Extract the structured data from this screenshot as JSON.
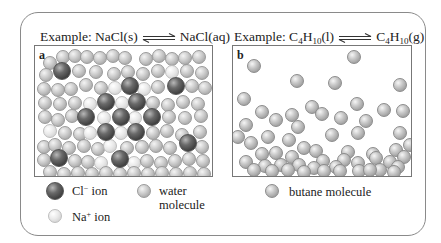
{
  "panel_a": {
    "label": "a",
    "title": {
      "prefix": "Example: ",
      "left": "NaCl(s)",
      "right": "NaCl(aq)"
    },
    "legend": [
      {
        "kind": "cl",
        "text": "Cl",
        "sup": "−",
        "suffix": " ion"
      },
      {
        "kind": "na",
        "text": "Na",
        "sup": "+",
        "suffix": " ion"
      },
      {
        "kind": "water",
        "line1": "water",
        "line2": "molecule"
      }
    ],
    "spheres": [
      {
        "t": "water",
        "x": 8,
        "y": 10
      },
      {
        "t": "water",
        "x": 21,
        "y": 4
      },
      {
        "t": "water",
        "x": 33,
        "y": 3
      },
      {
        "t": "water",
        "x": 45,
        "y": 4
      },
      {
        "t": "water",
        "x": 58,
        "y": 5
      },
      {
        "t": "water",
        "x": 71,
        "y": 3
      },
      {
        "t": "water",
        "x": 83,
        "y": 5
      },
      {
        "t": "water",
        "x": 104,
        "y": 6
      },
      {
        "t": "water",
        "x": 117,
        "y": 3
      },
      {
        "t": "water",
        "x": 130,
        "y": 6
      },
      {
        "t": "water",
        "x": 143,
        "y": 5
      },
      {
        "t": "water",
        "x": 157,
        "y": 4
      },
      {
        "t": "water",
        "x": 4,
        "y": 22
      },
      {
        "t": "cl",
        "x": 18,
        "y": 16
      },
      {
        "t": "water",
        "x": 37,
        "y": 18
      },
      {
        "t": "water",
        "x": 54,
        "y": 19
      },
      {
        "t": "water",
        "x": 72,
        "y": 21
      },
      {
        "t": "water",
        "x": 86,
        "y": 19
      },
      {
        "t": "water",
        "x": 101,
        "y": 21
      },
      {
        "t": "water",
        "x": 116,
        "y": 18
      },
      {
        "t": "na",
        "x": 130,
        "y": 19
      },
      {
        "t": "water",
        "x": 145,
        "y": 18
      },
      {
        "t": "water",
        "x": 160,
        "y": 20
      },
      {
        "t": "water",
        "x": 2,
        "y": 36
      },
      {
        "t": "water",
        "x": 16,
        "y": 37
      },
      {
        "t": "water",
        "x": 29,
        "y": 36
      },
      {
        "t": "water",
        "x": 44,
        "y": 32
      },
      {
        "t": "water",
        "x": 59,
        "y": 35
      },
      {
        "t": "na",
        "x": 73,
        "y": 35
      },
      {
        "t": "cl",
        "x": 86,
        "y": 31
      },
      {
        "t": "na",
        "x": 102,
        "y": 36
      },
      {
        "t": "water",
        "x": 116,
        "y": 34
      },
      {
        "t": "cl",
        "x": 132,
        "y": 31
      },
      {
        "t": "water",
        "x": 150,
        "y": 33
      },
      {
        "t": "water",
        "x": 163,
        "y": 35
      },
      {
        "t": "water",
        "x": 3,
        "y": 50
      },
      {
        "t": "water",
        "x": 18,
        "y": 51
      },
      {
        "t": "water",
        "x": 33,
        "y": 50
      },
      {
        "t": "na",
        "x": 48,
        "y": 51
      },
      {
        "t": "cl",
        "x": 62,
        "y": 47
      },
      {
        "t": "na",
        "x": 80,
        "y": 50
      },
      {
        "t": "cl",
        "x": 93,
        "y": 47
      },
      {
        "t": "water",
        "x": 111,
        "y": 50
      },
      {
        "t": "water",
        "x": 126,
        "y": 52
      },
      {
        "t": "water",
        "x": 141,
        "y": 49
      },
      {
        "t": "water",
        "x": 156,
        "y": 51
      },
      {
        "t": "water",
        "x": 3,
        "y": 64
      },
      {
        "t": "water",
        "x": 16,
        "y": 67
      },
      {
        "t": "water",
        "x": 30,
        "y": 63
      },
      {
        "t": "cl",
        "x": 42,
        "y": 62
      },
      {
        "t": "na",
        "x": 62,
        "y": 65
      },
      {
        "t": "cl",
        "x": 77,
        "y": 62
      },
      {
        "t": "na",
        "x": 93,
        "y": 65
      },
      {
        "t": "cl",
        "x": 108,
        "y": 62
      },
      {
        "t": "water",
        "x": 127,
        "y": 64
      },
      {
        "t": "water",
        "x": 143,
        "y": 65
      },
      {
        "t": "water",
        "x": 159,
        "y": 63
      },
      {
        "t": "na",
        "x": 8,
        "y": 78
      },
      {
        "t": "water",
        "x": 23,
        "y": 80
      },
      {
        "t": "water",
        "x": 38,
        "y": 81
      },
      {
        "t": "na",
        "x": 48,
        "y": 80
      },
      {
        "t": "cl",
        "x": 62,
        "y": 77
      },
      {
        "t": "na",
        "x": 79,
        "y": 80
      },
      {
        "t": "cl",
        "x": 92,
        "y": 77
      },
      {
        "t": "water",
        "x": 111,
        "y": 80
      },
      {
        "t": "water",
        "x": 125,
        "y": 78
      },
      {
        "t": "water",
        "x": 140,
        "y": 82
      },
      {
        "t": "water",
        "x": 158,
        "y": 79
      },
      {
        "t": "water",
        "x": 2,
        "y": 94
      },
      {
        "t": "water",
        "x": 13,
        "y": 92
      },
      {
        "t": "water",
        "x": 27,
        "y": 95
      },
      {
        "t": "water",
        "x": 42,
        "y": 93
      },
      {
        "t": "water",
        "x": 56,
        "y": 96
      },
      {
        "t": "na",
        "x": 68,
        "y": 93
      },
      {
        "t": "water",
        "x": 85,
        "y": 95
      },
      {
        "t": "water",
        "x": 100,
        "y": 94
      },
      {
        "t": "water",
        "x": 114,
        "y": 93
      },
      {
        "t": "water",
        "x": 128,
        "y": 95
      },
      {
        "t": "cl",
        "x": 144,
        "y": 88
      },
      {
        "t": "water",
        "x": 160,
        "y": 94
      },
      {
        "t": "water",
        "x": 2,
        "y": 107
      },
      {
        "t": "cl",
        "x": 15,
        "y": 103
      },
      {
        "t": "water",
        "x": 33,
        "y": 108
      },
      {
        "t": "water",
        "x": 46,
        "y": 109
      },
      {
        "t": "na",
        "x": 59,
        "y": 110
      },
      {
        "t": "cl",
        "x": 76,
        "y": 104
      },
      {
        "t": "na",
        "x": 92,
        "y": 110
      },
      {
        "t": "water",
        "x": 105,
        "y": 108
      },
      {
        "t": "water",
        "x": 119,
        "y": 110
      },
      {
        "t": "water",
        "x": 133,
        "y": 108
      },
      {
        "t": "water",
        "x": 147,
        "y": 106
      },
      {
        "t": "water",
        "x": 161,
        "y": 108
      },
      {
        "t": "water",
        "x": 8,
        "y": 119
      },
      {
        "t": "water",
        "x": 22,
        "y": 121
      },
      {
        "t": "water",
        "x": 36,
        "y": 120
      },
      {
        "t": "water",
        "x": 50,
        "y": 121
      },
      {
        "t": "water",
        "x": 64,
        "y": 120
      },
      {
        "t": "water",
        "x": 78,
        "y": 121
      },
      {
        "t": "water",
        "x": 92,
        "y": 120
      },
      {
        "t": "water",
        "x": 106,
        "y": 121
      },
      {
        "t": "water",
        "x": 120,
        "y": 120
      },
      {
        "t": "water",
        "x": 134,
        "y": 121
      },
      {
        "t": "water",
        "x": 148,
        "y": 120
      },
      {
        "t": "water",
        "x": 162,
        "y": 121
      }
    ]
  },
  "panel_b": {
    "label": "b",
    "title": {
      "prefix": "Example: ",
      "left_a": "C",
      "left_s1": "4",
      "left_b": "H",
      "left_s2": "10",
      "left_c": "(l)",
      "right_a": "C",
      "right_s1": "4",
      "right_b": "H",
      "right_s2": "10",
      "right_c": "(g)"
    },
    "legend": [
      {
        "kind": "butane",
        "text": "butane molecule"
      }
    ],
    "spheres": [
      {
        "x": 14,
        "y": 13
      },
      {
        "x": 114,
        "y": 4
      },
      {
        "x": 57,
        "y": 28
      },
      {
        "x": 95,
        "y": 30
      },
      {
        "x": 160,
        "y": 32
      },
      {
        "x": 4,
        "y": 46
      },
      {
        "x": 117,
        "y": 51
      },
      {
        "x": 72,
        "y": 54
      },
      {
        "x": 144,
        "y": 57
      },
      {
        "x": 163,
        "y": 58
      },
      {
        "x": 22,
        "y": 59
      },
      {
        "x": 52,
        "y": 62
      },
      {
        "x": 36,
        "y": 67
      },
      {
        "x": 82,
        "y": 61
      },
      {
        "x": 101,
        "y": 65
      },
      {
        "x": 126,
        "y": 68
      },
      {
        "x": 6,
        "y": 72
      },
      {
        "x": 58,
        "y": 74
      },
      {
        "x": 92,
        "y": 82
      },
      {
        "x": 118,
        "y": 80
      },
      {
        "x": 160,
        "y": 80
      },
      {
        "x": -2,
        "y": 84
      },
      {
        "x": 28,
        "y": 84
      },
      {
        "x": 49,
        "y": 87
      },
      {
        "x": 11,
        "y": 90
      },
      {
        "x": 64,
        "y": 95
      },
      {
        "x": 76,
        "y": 98
      },
      {
        "x": 108,
        "y": 99
      },
      {
        "x": 133,
        "y": 101
      },
      {
        "x": 156,
        "y": 97
      },
      {
        "x": 170,
        "y": 92
      },
      {
        "x": 22,
        "y": 101
      },
      {
        "x": 36,
        "y": 100
      },
      {
        "x": 52,
        "y": 104
      },
      {
        "x": 83,
        "y": 108
      },
      {
        "x": 104,
        "y": 107
      },
      {
        "x": 118,
        "y": 110
      },
      {
        "x": 136,
        "y": 105
      },
      {
        "x": 150,
        "y": 109
      },
      {
        "x": 164,
        "y": 104
      },
      {
        "x": 6,
        "y": 109
      },
      {
        "x": 25,
        "y": 113
      },
      {
        "x": 41,
        "y": 112
      },
      {
        "x": 59,
        "y": 112
      },
      {
        "x": 74,
        "y": 115
      },
      {
        "x": 96,
        "y": 114
      },
      {
        "x": 119,
        "y": 118
      },
      {
        "x": 140,
        "y": 117
      },
      {
        "x": 158,
        "y": 114
      },
      {
        "x": 14,
        "y": 117
      },
      {
        "x": 32,
        "y": 118
      },
      {
        "x": 48,
        "y": 117
      },
      {
        "x": 64,
        "y": 119
      },
      {
        "x": 84,
        "y": 118
      },
      {
        "x": 100,
        "y": 118
      },
      {
        "x": 130,
        "y": 117
      },
      {
        "x": 154,
        "y": 119
      }
    ]
  }
}
